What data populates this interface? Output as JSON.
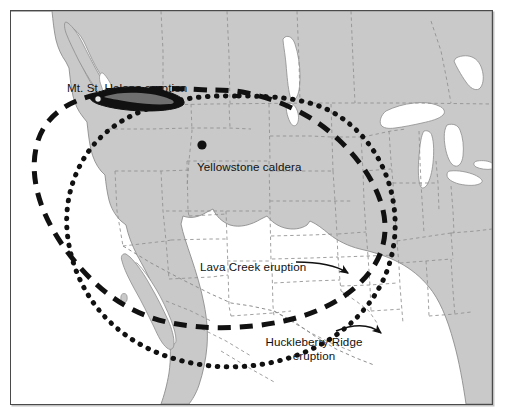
{
  "figure": {
    "name": "volcanic-ashfall-map",
    "region": "Western and central North America",
    "background_color": "#ffffff",
    "land_color": "#c9c9c9",
    "water_color": "#ffffff",
    "border_color": "#4a4a4a",
    "ink_color": "#111111"
  },
  "labels": {
    "mt_st_helens": "Mt. St. Helens eruption",
    "yellowstone": "Yellowstone caldera",
    "lava_creek": "Lava Creek eruption",
    "huckleberry_line1": "Huckleberry Ridge",
    "huckleberry_line2": "eruption"
  },
  "markers": {
    "yellowstone_caldera": {
      "name": "yellowstone-caldera-dot",
      "shape": "filled-circle",
      "color": "#111111"
    },
    "mt_st_helens_plume": {
      "name": "mt-st-helens-ash-plume",
      "shape": "elongated-lens",
      "color": "#111111"
    }
  },
  "ashfall_extents": [
    {
      "id": "lava-creek",
      "label": "Lava Creek eruption",
      "line_style": "dashed",
      "line_color": "#111111",
      "line_width_px": 5,
      "dash_pattern": "13 9",
      "description": "Large dashed oval covering the western and central United States"
    },
    {
      "id": "huckleberry-ridge",
      "label": "Huckleberry Ridge eruption",
      "line_style": "dotted",
      "line_color": "#111111",
      "line_width_px": 5,
      "dash_pattern": "1 8",
      "description": "Large dotted oval extending farther south and east than the Lava Creek extent"
    },
    {
      "id": "mt-st-helens",
      "label": "Mt. St. Helens eruption",
      "line_style": "solid-filled",
      "line_color": "#111111",
      "description": "Small filled lens-shaped ash plume east of the volcano in Washington State"
    }
  ],
  "annotations": [
    {
      "name": "lava-creek-leader",
      "from": "Lava Creek eruption label",
      "to": "dashed oval boundary",
      "arrow": true
    },
    {
      "name": "huckleberry-ridge-leader",
      "from": "Huckleberry Ridge eruption label",
      "to": "dotted oval boundary",
      "arrow": true
    }
  ]
}
